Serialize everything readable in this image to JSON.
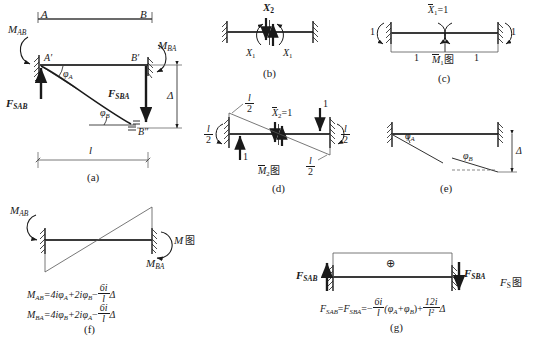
{
  "figure": {
    "colors": {
      "ink": "#1a1a1a",
      "beam": "#3a3a3a",
      "thin": "#555555"
    }
  },
  "panels": [
    {
      "id": "a",
      "caption": "(a)",
      "labels": {
        "node_a": "A",
        "node_b": "B",
        "node_a_prime": "A′",
        "node_b_prime": "B′",
        "node_b_dprime": "B″",
        "moment_ab": "M",
        "moment_ab_sub": "AB",
        "moment_ba": "M",
        "moment_ba_sub": "BA",
        "shear_ab": "F",
        "shear_ab_sub": "SAB",
        "shear_ba": "F",
        "shear_ba_sub": "SBA",
        "rotation_a": "φ",
        "rotation_a_sub": "A",
        "rotation_b": "φ",
        "rotation_b_sub": "B",
        "deflection": "Δ",
        "span": "l"
      }
    },
    {
      "id": "b",
      "caption": "(b)",
      "labels": {
        "x2": "X",
        "x2_sub": "2",
        "x1_left": "X",
        "x1_left_sub": "1",
        "x1_right": "X",
        "x1_right_sub": "1"
      }
    },
    {
      "id": "c",
      "caption": "(c)",
      "labels": {
        "unit_redundant": "X",
        "unit_redundant_sub": "1",
        "unit_redundant_eq": "=1",
        "left_outer": "1",
        "right_outer": "1",
        "left_inner": "1",
        "right_inner": "1",
        "diagram": "M",
        "diagram_sub": "1",
        "diagram_cn": "图"
      }
    },
    {
      "id": "d",
      "caption": "(d)",
      "labels": {
        "unit_redundant": "X",
        "unit_redundant_sub": "2",
        "unit_redundant_eq": "=1",
        "frac_top_num": "l",
        "frac_top_den": "2",
        "frac_left_num": "l",
        "frac_left_den": "2",
        "frac_right_num": "l",
        "frac_right_den": "2",
        "frac_bottom_num": "l",
        "frac_bottom_den": "2",
        "reaction_left": "1",
        "reaction_right": "1",
        "diagram": "M",
        "diagram_sub": "2",
        "diagram_cn": "图"
      }
    },
    {
      "id": "e",
      "caption": "(e)",
      "labels": {
        "rotation_a": "φ",
        "rotation_a_sub": "A",
        "rotation_b": "φ",
        "rotation_b_sub": "B",
        "deflection": "Δ"
      }
    },
    {
      "id": "f",
      "caption": "(f)",
      "labels": {
        "moment_ab": "M",
        "moment_ab_sub": "AB",
        "moment_ba": "M",
        "moment_ba_sub": "BA",
        "diagram": "M",
        "diagram_cn": "图"
      },
      "equations": [
        {
          "lhs": "M",
          "lhs_sub": "AB",
          "eq": "=4iφ",
          "t1_sub": "A",
          "plus": "+2iφ",
          "t2_sub": "B",
          "minus": "−",
          "frac_num": "6i",
          "frac_den": "l",
          "tail": "Δ"
        },
        {
          "lhs": "M",
          "lhs_sub": "BA",
          "eq": "=4iφ",
          "t1_sub": "B",
          "plus": "+2iφ",
          "t2_sub": "A",
          "minus": "−",
          "frac_num": "6i",
          "frac_den": "l",
          "tail": "Δ"
        }
      ]
    },
    {
      "id": "g",
      "caption": "(g)",
      "labels": {
        "shear_ab": "F",
        "shear_ab_sub": "SAB",
        "shear_ba": "F",
        "shear_ba_sub": "SBA",
        "plus_sign": "⊕",
        "diagram": "F",
        "diagram_sub": "S",
        "diagram_cn": "图"
      },
      "equation": {
        "lhs1": "F",
        "lhs1_sub": "SAB",
        "eq1": "=",
        "lhs2": "F",
        "lhs2_sub": "SBA",
        "eq2": "=−",
        "frac1_num": "6i",
        "frac1_den": "l",
        "mid": "(φ",
        "mid_sub1": "A",
        "mid_plus": "+φ",
        "mid_sub2": "B",
        "mid_close": ")+",
        "frac2_num": "12i",
        "frac2_den": "l²",
        "tail": "Δ"
      }
    }
  ]
}
